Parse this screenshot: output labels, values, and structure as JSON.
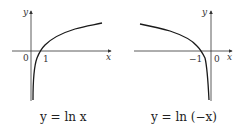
{
  "figures": [
    {
      "id": "ln-x",
      "caption": "y = ln x",
      "axis_labels": {
        "x": "x",
        "y": "y"
      },
      "tick_labels": {
        "origin": "0",
        "root": "1"
      },
      "function": "ln(x)",
      "colors": {
        "axis": "#333333",
        "curve": "#1a1a1a"
      }
    },
    {
      "id": "ln-neg-x",
      "caption": "y = ln (−x)",
      "axis_labels": {
        "x": "x",
        "y": "y"
      },
      "tick_labels": {
        "origin": "0",
        "root": "−1"
      },
      "function": "ln(-x)",
      "colors": {
        "axis": "#333333",
        "curve": "#1a1a1a"
      }
    }
  ]
}
